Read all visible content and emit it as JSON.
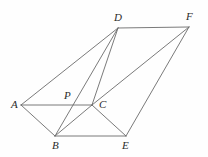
{
  "figure": {
    "background_color": "#fefefe",
    "line_color": "#6b6b6b",
    "label_color": "#2b2b2b",
    "canvas": {
      "width": 208,
      "height": 157
    },
    "vertices": [
      {
        "id": "A",
        "label": "A",
        "x": 21,
        "y": 105,
        "label_x": 11,
        "label_y": 99
      },
      {
        "id": "B",
        "label": "B",
        "x": 55,
        "y": 136,
        "label_x": 52,
        "label_y": 140
      },
      {
        "id": "C",
        "label": "C",
        "x": 92,
        "y": 105,
        "label_x": 99,
        "label_y": 99
      },
      {
        "id": "D",
        "label": "D",
        "x": 118,
        "y": 28,
        "label_x": 114,
        "label_y": 12
      },
      {
        "id": "E",
        "label": "E",
        "x": 126,
        "y": 136,
        "label_x": 122,
        "label_y": 140
      },
      {
        "id": "F",
        "label": "F",
        "x": 189,
        "y": 27,
        "label_x": 186,
        "label_y": 11
      },
      {
        "id": "P",
        "label": "P",
        "x": 71,
        "y": 103,
        "label_x": 64,
        "label_y": 90
      }
    ],
    "edges": [
      {
        "id": "AD",
        "from": "A",
        "to": "D"
      },
      {
        "id": "AC",
        "from": "A",
        "to": "C"
      },
      {
        "id": "AB",
        "from": "A",
        "to": "B"
      },
      {
        "id": "BD",
        "from": "B",
        "to": "D"
      },
      {
        "id": "BC",
        "from": "B",
        "to": "C"
      },
      {
        "id": "BE",
        "from": "B",
        "to": "E"
      },
      {
        "id": "CD",
        "from": "C",
        "to": "D"
      },
      {
        "id": "CE",
        "from": "C",
        "to": "E"
      },
      {
        "id": "CF",
        "from": "C",
        "to": "F"
      },
      {
        "id": "DF",
        "from": "D",
        "to": "F"
      },
      {
        "id": "EF",
        "from": "E",
        "to": "F"
      }
    ]
  }
}
